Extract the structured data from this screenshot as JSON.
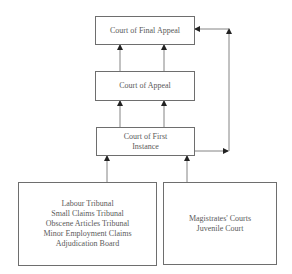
{
  "diagram": {
    "type": "court-hierarchy",
    "nodes": [
      {
        "id": "final-appeal",
        "lines": [
          "Court of Final Appeal"
        ]
      },
      {
        "id": "appeal",
        "lines": [
          "Court of Appeal"
        ]
      },
      {
        "id": "first-instance",
        "lines": [
          "Court of First",
          "Instance"
        ]
      },
      {
        "id": "tribunals",
        "lines": [
          "Labour Tribunal",
          "Small Claims Tribunal",
          "Obscene Articles Tribunal",
          "Minor Employment Claims",
          "Adjudication Board"
        ]
      },
      {
        "id": "magistrates",
        "lines": [
          "Magistrates' Courts",
          "Juvenile Court"
        ]
      }
    ],
    "edges": [
      {
        "from": "appeal",
        "to": "final-appeal",
        "count": 2
      },
      {
        "from": "first-instance",
        "to": "appeal",
        "count": 2
      },
      {
        "from": "first-instance",
        "to": "final-appeal",
        "count": 1,
        "route": "right-side"
      },
      {
        "from": "tribunals",
        "to": "first-instance",
        "count": 1
      },
      {
        "from": "magistrates",
        "to": "first-instance",
        "count": 1
      }
    ],
    "colors": {
      "line": "#5a5a5a",
      "border": "#6e6e6e",
      "text": "#5a5a5a"
    }
  }
}
